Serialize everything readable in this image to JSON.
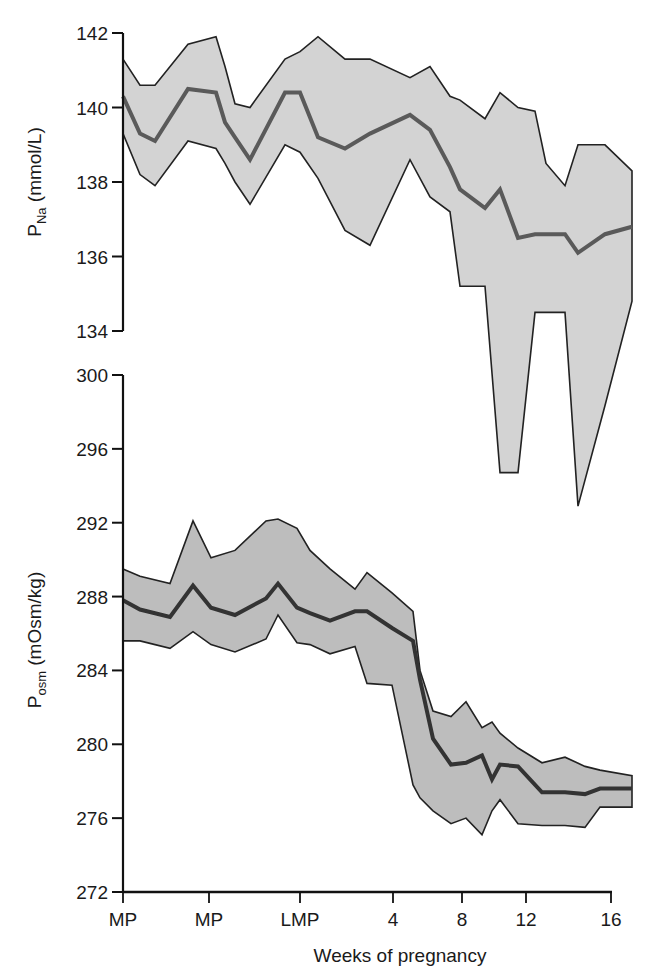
{
  "chart_data": [
    {
      "type": "area",
      "panel": "top",
      "title": "",
      "ylabel": "P_Na (mmol/L)",
      "ylabel_main": "P",
      "ylabel_sub": "Na",
      "ylabel_unit": " (mmol/L)",
      "ylim": [
        134,
        142
      ],
      "yticks": [
        134,
        136,
        138,
        140,
        142
      ],
      "grid": false,
      "fill_color": "#d3d3d3",
      "line_color": "#5a5a5a",
      "x_px": [
        123,
        140,
        155,
        188,
        216,
        225,
        235,
        250,
        285,
        300,
        318,
        345,
        370,
        410,
        430,
        450,
        460,
        485,
        500,
        518,
        535,
        546,
        565,
        578,
        605,
        632
      ],
      "series": [
        {
          "name": "upper",
          "values": [
            141.3,
            140.6,
            140.6,
            141.7,
            141.9,
            141.1,
            140.1,
            140.0,
            141.3,
            141.5,
            141.9,
            141.3,
            141.3,
            140.8,
            141.1,
            140.3,
            140.2,
            139.7,
            140.4,
            140.0,
            139.9,
            138.5,
            137.9,
            139.0,
            139.0,
            138.3
          ]
        },
        {
          "name": "mean",
          "values": [
            140.3,
            139.3,
            139.1,
            140.5,
            140.4,
            139.6,
            139.2,
            138.6,
            140.4,
            140.4,
            139.2,
            138.9,
            139.3,
            139.8,
            139.4,
            138.4,
            137.8,
            137.3,
            137.8,
            136.5,
            136.6,
            136.6,
            136.6,
            136.1,
            136.6,
            136.8
          ]
        },
        {
          "name": "lower",
          "values": [
            139.3,
            138.2,
            137.9,
            139.1,
            138.9,
            138.5,
            138.0,
            137.4,
            139.0,
            138.8,
            138.1,
            136.7,
            136.3,
            138.6,
            137.6,
            137.2,
            135.2,
            135.2,
            130.2,
            130.2,
            134.5,
            134.5,
            134.5,
            129.3,
            132.0,
            134.8
          ]
        }
      ]
    },
    {
      "type": "area",
      "panel": "bottom",
      "title": "",
      "ylabel": "P_osm (mOsm/kg)",
      "ylabel_main": "P",
      "ylabel_sub": "osm",
      "ylabel_unit": " (mOsm/kg)",
      "ylim": [
        272,
        300
      ],
      "yticks": [
        272,
        276,
        280,
        284,
        288,
        292,
        296,
        300
      ],
      "grid": false,
      "fill_color": "#bdbdbd",
      "line_color": "#333333",
      "x_px": [
        123,
        140,
        170,
        193,
        211,
        235,
        266,
        278,
        297,
        310,
        330,
        355,
        367,
        392,
        413,
        420,
        433,
        451,
        466,
        482,
        492,
        500,
        518,
        542,
        565,
        585,
        600,
        632
      ],
      "series": [
        {
          "name": "upper",
          "values": [
            289.5,
            289.1,
            288.7,
            292.1,
            290.1,
            290.5,
            292.1,
            292.2,
            291.7,
            290.5,
            289.5,
            288.4,
            289.3,
            288.2,
            287.2,
            284.0,
            281.8,
            281.5,
            282.3,
            280.9,
            281.2,
            280.6,
            279.8,
            279.0,
            279.3,
            278.8,
            278.6,
            278.3
          ]
        },
        {
          "name": "mean",
          "values": [
            287.8,
            287.3,
            286.9,
            288.6,
            287.4,
            287.0,
            287.9,
            288.7,
            287.4,
            287.1,
            286.7,
            287.2,
            287.2,
            286.3,
            285.6,
            283.5,
            280.3,
            278.9,
            279.0,
            279.4,
            278.1,
            278.9,
            278.8,
            277.4,
            277.4,
            277.3,
            277.6,
            277.6
          ]
        },
        {
          "name": "lower",
          "values": [
            285.6,
            285.6,
            285.2,
            286.1,
            285.4,
            285.0,
            285.7,
            287.0,
            285.5,
            285.4,
            284.9,
            285.3,
            283.3,
            283.2,
            277.8,
            277.1,
            276.4,
            275.7,
            276.0,
            275.1,
            276.4,
            277.0,
            275.7,
            275.6,
            275.6,
            275.5,
            276.6,
            276.6
          ]
        }
      ]
    }
  ],
  "x_axis": {
    "title": "Weeks of pregnancy",
    "ticks": [
      {
        "label": "MP",
        "x": 123
      },
      {
        "label": "MP",
        "x": 209
      },
      {
        "label": "LMP",
        "x": 300
      },
      {
        "label": "4",
        "x": 393
      },
      {
        "label": "8",
        "x": 462
      },
      {
        "label": "12",
        "x": 526
      },
      {
        "label": "16",
        "x": 611
      }
    ]
  }
}
